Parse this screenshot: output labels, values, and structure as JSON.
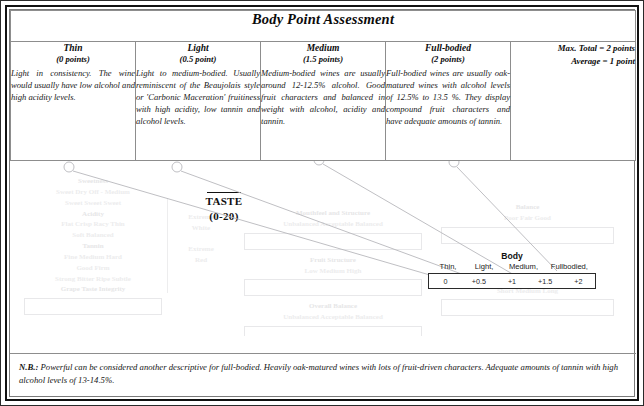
{
  "document": {
    "title": "Body Point Assessment"
  },
  "categories": [
    {
      "name": "Thin",
      "points": "(0 points)",
      "description": "Light in consistency. The wine would usually have low alcohol and high acidity levels."
    },
    {
      "name": "Light",
      "points": "(0.5 point)",
      "description": "Light to medium-bodied. Usually reminiscent of the Beaujolais style or 'Carbonic Maceration' fruitiness with high acidity, low tannin and alcohol levels."
    },
    {
      "name": "Medium",
      "points": "(1.5 points)",
      "description": "Medium-bodied wines are usually around 12-12.5% alcohol. Good fruit characters and balanced in weight with alcohol, acidity and tannin."
    },
    {
      "name": "Full-bodied",
      "points": "(2 points)",
      "description": "Full-bodied wines are usually oak-matured wines with alcohol levels of 12.5% to 13.5 %. They display compound fruit characters and have adequate amounts of tannin."
    }
  ],
  "summary": {
    "max_total": "Max. Total = 2 points",
    "average": "Average = 1 point"
  },
  "taste_heading": {
    "label": "TASTE",
    "range": "(0-20)"
  },
  "body_callout": {
    "title": "Body",
    "labels": [
      "Thin,",
      "Light,",
      "Medium,",
      "Fullbodied,"
    ],
    "values": [
      "0",
      "+0.5",
      "+1",
      "+1.5",
      "+2"
    ]
  },
  "footnote": {
    "prefix": "N.B.:",
    "text": " Powerful can be considered another descriptive for full-bodied. Heavily oak-matured wines with lots of fruit-driven characters. Adequate amounts of tannin with high alcohol levels of 13-14.5%."
  },
  "background_sheet": {
    "column_a": [
      "Sweetness",
      "Sweet Dry Off - Medium",
      "Sweet Sweet Sweet",
      "Acidity",
      "Flat Crisp Racy Thin",
      "Soft Balanced",
      "Tannin",
      "Fine Medium Hard",
      "Good Firm",
      "Strong Bitter Ripe Subtle"
    ],
    "column_a_footer": "Grape Taste Integrity",
    "column_b": [
      "Extreme",
      "White",
      "Extreme",
      "Red"
    ],
    "column_c": [
      "Mouthfeel and Structure",
      "Unbalanced  Acceptable  Balanced",
      "Fruit Structure",
      "Low  Medium  High",
      "Overall Balance"
    ],
    "column_d": [
      "Balance",
      "Poor  Fair  Good",
      "Length",
      "Short  Medium  Long"
    ]
  },
  "colors": {
    "frame": "#111111",
    "rule": "#8d8d8d",
    "faded_text": "#ececed",
    "leader_line": "#b8b8bc"
  }
}
